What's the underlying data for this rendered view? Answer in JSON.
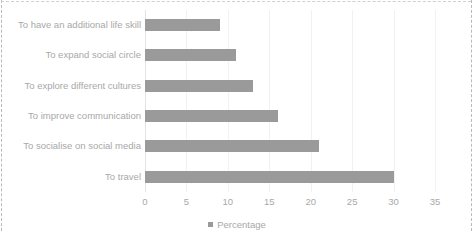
{
  "chart_data": {
    "type": "bar",
    "orientation": "horizontal",
    "title": "",
    "xlabel": "",
    "ylabel": "",
    "categories": [
      "To have an additional life skill",
      "To expand social circle",
      "To explore different cultures",
      "To improve communication",
      "To socialise on social media",
      "To travel"
    ],
    "values": [
      9,
      11,
      13,
      16,
      21,
      30
    ],
    "series": [
      {
        "name": "Percentage",
        "values": [
          9,
          11,
          13,
          16,
          21,
          30
        ]
      }
    ],
    "xlim": [
      0,
      35
    ],
    "xticks": [
      "0",
      "5",
      "10",
      "15",
      "20",
      "25",
      "30",
      "35"
    ],
    "xtick_values": [
      0,
      5,
      10,
      15,
      20,
      25,
      30,
      35
    ],
    "grid": true,
    "grid_axis": "x",
    "legend": {
      "position": "bottom",
      "entries": [
        {
          "label": "Percentage",
          "color": "#9a9a9a",
          "marker": "square"
        }
      ]
    },
    "colors": {
      "bar": "#9a9a9a",
      "text": "#a8a8a8",
      "gridline": "#f1f1f1",
      "axis": "#e4e4e4",
      "frame": "#b9b9b9",
      "background": "#ffffff"
    }
  }
}
